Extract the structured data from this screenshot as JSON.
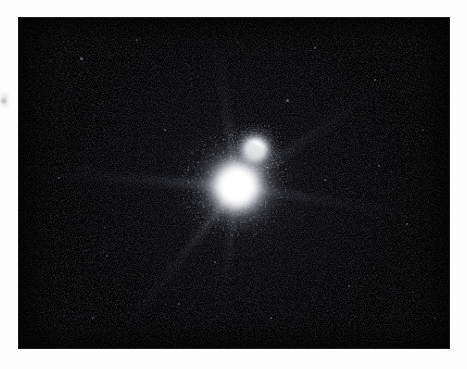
{
  "page": {
    "width_px": 467,
    "height_px": 369,
    "background_color": "#fdfdfd"
  },
  "image": {
    "kind": "astronomical-telescope-exposure",
    "subject": "binary star system",
    "frame": {
      "left_px": 19,
      "top_px": 18,
      "width_px": 430,
      "height_px": 330,
      "background_color": "#010102",
      "border_color": "#000000"
    },
    "margin_artifact": {
      "name": "film-edge-smudge",
      "left_px": 0,
      "top_px": 92,
      "width_px": 9,
      "height_px": 16,
      "color": "#aaacb2"
    }
  },
  "chart_data": {
    "type": "scatter",
    "title": "",
    "subtitle": "",
    "xlabel": "",
    "ylabel": "",
    "grid": false,
    "legend_position": "none",
    "axis_units": "pixels (frame-relative)",
    "xlim": [
      0,
      430
    ],
    "ylim": [
      0,
      330
    ],
    "colorscale": {
      "low": "#010102",
      "mid": "#6a6f7d",
      "high": "#ffffff"
    },
    "annotations": [],
    "series": [
      {
        "name": "Primary star",
        "values": [
          {
            "label": "primary",
            "x": 218,
            "y": 168,
            "core_radius_px": 14,
            "halo_radius_px": 46,
            "peak_brightness": 255,
            "color": "#ffffff"
          }
        ]
      },
      {
        "name": "Secondary star",
        "values": [
          {
            "label": "secondary",
            "x": 236,
            "y": 132,
            "core_radius_px": 7,
            "halo_radius_px": 24,
            "peak_brightness": 238,
            "color": "#f4f5f8"
          }
        ]
      }
    ],
    "diffraction_spikes": [
      {
        "name": "spike-west",
        "angle_deg": 184,
        "length_px": 212,
        "thickness_px": 17,
        "peak_brightness": 150
      },
      {
        "name": "spike-north",
        "angle_deg": 262,
        "length_px": 168,
        "thickness_px": 15,
        "peak_brightness": 132
      },
      {
        "name": "spike-northeast",
        "angle_deg": 326,
        "length_px": 198,
        "thickness_px": 16,
        "peak_brightness": 120
      },
      {
        "name": "spike-east",
        "angle_deg": 9,
        "length_px": 196,
        "thickness_px": 15,
        "peak_brightness": 112
      },
      {
        "name": "spike-southwest",
        "angle_deg": 128,
        "length_px": 204,
        "thickness_px": 15,
        "peak_brightness": 126
      },
      {
        "name": "spike-south",
        "angle_deg": 97,
        "length_px": 152,
        "thickness_px": 13,
        "peak_brightness": 100
      }
    ],
    "field_objects": [
      {
        "x": 62,
        "y": 40,
        "brightness": 60,
        "radius_px": 1.5
      },
      {
        "x": 118,
        "y": 22,
        "brightness": 52,
        "radius_px": 1.2
      },
      {
        "x": 296,
        "y": 30,
        "brightness": 58,
        "radius_px": 1.4
      },
      {
        "x": 356,
        "y": 62,
        "brightness": 48,
        "radius_px": 1.2
      },
      {
        "x": 404,
        "y": 112,
        "brightness": 44,
        "radius_px": 1.1
      },
      {
        "x": 388,
        "y": 206,
        "brightness": 50,
        "radius_px": 1.3
      },
      {
        "x": 330,
        "y": 268,
        "brightness": 46,
        "radius_px": 1.2
      },
      {
        "x": 252,
        "y": 300,
        "brightness": 54,
        "radius_px": 1.4
      },
      {
        "x": 160,
        "y": 286,
        "brightness": 50,
        "radius_px": 1.3
      },
      {
        "x": 88,
        "y": 238,
        "brightness": 46,
        "radius_px": 1.2
      },
      {
        "x": 40,
        "y": 160,
        "brightness": 44,
        "radius_px": 1.1
      },
      {
        "x": 146,
        "y": 112,
        "brightness": 56,
        "radius_px": 1.3
      },
      {
        "x": 306,
        "y": 162,
        "brightness": 58,
        "radius_px": 1.4
      },
      {
        "x": 196,
        "y": 244,
        "brightness": 52,
        "radius_px": 1.3
      },
      {
        "x": 268,
        "y": 82,
        "brightness": 62,
        "radius_px": 1.5
      },
      {
        "x": 74,
        "y": 300,
        "brightness": 42,
        "radius_px": 1.1
      },
      {
        "x": 416,
        "y": 300,
        "brightness": 40,
        "radius_px": 1.0
      },
      {
        "x": 360,
        "y": 148,
        "brightness": 48,
        "radius_px": 1.2
      }
    ]
  }
}
